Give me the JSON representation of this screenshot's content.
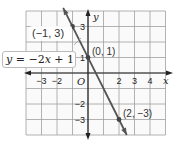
{
  "chart_data": {
    "type": "line",
    "title": "",
    "xlabel": "x",
    "ylabel": "y",
    "origin_label": "O",
    "xlim": [
      -4,
      5
    ],
    "ylim": [
      -4,
      4
    ],
    "x_ticks": [
      -3,
      -2,
      2,
      3,
      4
    ],
    "y_ticks": [
      3,
      1,
      -2,
      -3
    ],
    "x_tick_labels": [
      "−3",
      "−2",
      "2",
      "3",
      "4"
    ],
    "y_tick_labels": [
      "3",
      "1",
      "−2",
      "−3"
    ],
    "grid": true,
    "series": [
      {
        "name": "y = −2x + 1",
        "equation": "y = −2x + 1",
        "slope": -2,
        "intercept": 1,
        "color": "#555555",
        "points": [
          {
            "x": -1,
            "y": 3,
            "label": "(−1, 3)"
          },
          {
            "x": 0,
            "y": 1,
            "label": "(0, 1)"
          },
          {
            "x": 2,
            "y": -3,
            "label": "(2, −3)"
          }
        ]
      }
    ]
  },
  "labels": {
    "equation": "y = −2x + 1",
    "equation_lhs": "y",
    "equation_rhs": " = −2",
    "equation_var": "x",
    "equation_tail": " + 1",
    "point_a": "(−1, 3)",
    "point_b": "(0, 1)",
    "point_c": "(2, −3)",
    "x_axis": "x",
    "y_axis": "y",
    "origin": "O"
  },
  "colors": {
    "grid": "#9a9a9a",
    "axis": "#222222",
    "line": "#555555",
    "background": "#ffffff"
  }
}
